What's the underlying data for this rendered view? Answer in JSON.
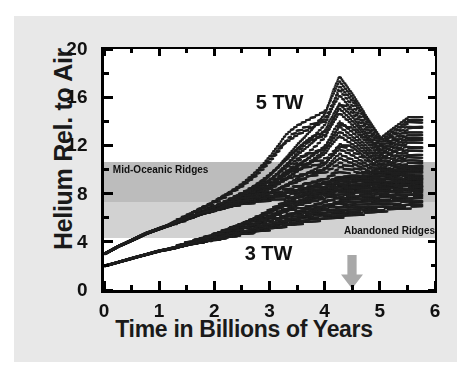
{
  "chart_data": {
    "type": "scatter",
    "title": "",
    "xlabel": "Time in Billions of Years",
    "ylabel": "Helium Rel. to Air",
    "xlim": [
      0,
      6
    ],
    "ylim": [
      0,
      20
    ],
    "grid": false,
    "legend_position": "none",
    "x_ticks": [
      "0",
      "1",
      "2",
      "3",
      "4",
      "5",
      "6"
    ],
    "x_tick_values": [
      0,
      1,
      2,
      3,
      4,
      5,
      6
    ],
    "x_minor_tick_values": [
      0.5,
      1.5,
      2.5,
      3.5,
      4.5,
      5.5
    ],
    "y_ticks": [
      "0",
      "4",
      "8",
      "12",
      "16",
      "20"
    ],
    "y_tick_values": [
      0,
      4,
      8,
      12,
      16,
      20
    ],
    "y_minor_tick_values": [
      2,
      6,
      10,
      14,
      18
    ],
    "bands": [
      {
        "name": "Abandoned Ridges",
        "label": "Abandoned Ridges",
        "y_min": 4.3,
        "y_max": 10.6,
        "color": "#d2d2d2",
        "label_x": 4.35,
        "label_y": 4.9
      },
      {
        "name": "Mid-Oceanic Ridges",
        "label": "Mid-Oceanic Ridges",
        "y_min": 7.3,
        "y_max": 10.6,
        "color": "#bcbcbc",
        "label_x": 0.16,
        "label_y": 10.0
      }
    ],
    "annotations": [
      {
        "name": "series-label-5tw",
        "text": "5 TW",
        "x": 2.75,
        "y": 15.5
      },
      {
        "name": "series-label-3tw",
        "text": "3 TW",
        "x": 2.55,
        "y": 3.0
      }
    ],
    "arrow": {
      "name": "present-day-arrow",
      "x": 4.5,
      "y_top": 2.9,
      "y_bottom": 0.1,
      "color": "#a8a8a8",
      "direction": "down"
    },
    "series": [
      {
        "name": "5 TW",
        "label": "5 TW",
        "color": "#1f1f1f",
        "marker": "square",
        "start_value": 3.0,
        "description": "Upper population: helium rises steeply from 3 at t=0 to about 7 by t=1.7, then fans out into many sub-branches reaching 10-18 by t=3-5.7.",
        "n_runs": 26,
        "trend_x": [
          0.0,
          0.25,
          0.5,
          0.75,
          1.0,
          1.25,
          1.5,
          1.75,
          2.0,
          2.25,
          2.5,
          2.75,
          3.0,
          3.25,
          3.5,
          3.75,
          4.0,
          4.25,
          4.5,
          5.0,
          5.5,
          5.7
        ],
        "trend_y": [
          3.0,
          3.8,
          4.5,
          5.2,
          5.8,
          6.3,
          6.8,
          7.1,
          7.5,
          7.9,
          8.4,
          9.0,
          9.6,
          10.3,
          11.0,
          11.6,
          12.2,
          12.6,
          12.1,
          11.4,
          11.6,
          11.8
        ],
        "spread_low": [
          3.0,
          3.6,
          4.1,
          4.6,
          5.0,
          5.4,
          5.8,
          6.2,
          6.5,
          6.8,
          7.0,
          7.1,
          7.2,
          7.3,
          7.4,
          7.5,
          7.6,
          7.7,
          7.8,
          7.9,
          8.0,
          8.0
        ],
        "spread_high": [
          3.1,
          4.1,
          5.0,
          5.9,
          6.6,
          7.2,
          7.7,
          8.1,
          8.6,
          9.2,
          9.9,
          10.8,
          11.8,
          12.9,
          13.8,
          14.4,
          15.0,
          17.5,
          16.0,
          12.5,
          14.2,
          14.2
        ]
      },
      {
        "name": "3 TW",
        "label": "3 TW",
        "color": "#1f1f1f",
        "marker": "square",
        "start_value": 2.0,
        "description": "Lower population: helium rises from 2 at t=0 to about 4.5 by t=1.8, then branches flatten and fan between 4.5 and 10 for t=2-5.7.",
        "n_runs": 22,
        "trend_x": [
          0.0,
          0.25,
          0.5,
          0.75,
          1.0,
          1.25,
          1.5,
          1.75,
          2.0,
          2.25,
          2.5,
          2.75,
          3.0,
          3.25,
          3.5,
          3.75,
          4.0,
          4.25,
          4.5,
          5.0,
          5.5,
          5.7
        ],
        "trend_y": [
          2.0,
          2.4,
          2.8,
          3.2,
          3.6,
          3.9,
          4.2,
          4.5,
          4.8,
          5.1,
          5.4,
          5.8,
          6.2,
          6.6,
          7.0,
          7.4,
          7.8,
          8.1,
          8.4,
          8.9,
          9.3,
          9.4
        ],
        "spread_low": [
          2.0,
          2.3,
          2.6,
          2.9,
          3.2,
          3.4,
          3.7,
          3.9,
          4.1,
          4.3,
          4.5,
          4.7,
          4.9,
          5.1,
          5.3,
          5.5,
          5.7,
          5.8,
          6.0,
          6.3,
          6.6,
          6.7
        ],
        "spread_high": [
          2.1,
          2.6,
          3.1,
          3.6,
          4.1,
          4.5,
          4.9,
          5.3,
          5.7,
          6.1,
          6.5,
          6.9,
          7.3,
          7.7,
          8.1,
          8.5,
          8.9,
          9.2,
          9.5,
          9.8,
          10.2,
          10.3
        ]
      }
    ]
  }
}
